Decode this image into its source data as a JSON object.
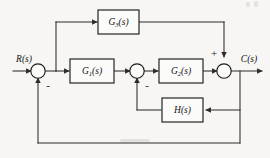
{
  "diagram": {
    "type": "control-system-block-diagram",
    "background_color": "#f7f6f4",
    "line_color": "#2b2b2b",
    "input": {
      "label": "R(s)",
      "name": "input-signal-label"
    },
    "output": {
      "label": "C(s)",
      "name": "output-signal-label"
    },
    "blocks": [
      {
        "id": "g3",
        "label_base": "G",
        "label_sub": "3",
        "label_tail": "(s)",
        "label_full": "G3(s)",
        "role": "feedforward-path"
      },
      {
        "id": "g1",
        "label_base": "G",
        "label_sub": "1",
        "label_tail": "(s)",
        "label_full": "G1(s)",
        "role": "forward-path-first"
      },
      {
        "id": "g2",
        "label_base": "G",
        "label_sub": "2",
        "label_tail": "(s)",
        "label_full": "G2(s)",
        "role": "forward-path-second"
      },
      {
        "id": "h",
        "label_base": "H",
        "label_sub": "",
        "label_tail": "(s)",
        "label_full": "H(s)",
        "role": "inner-feedback"
      }
    ],
    "summing_junctions": [
      {
        "id": "sum1",
        "signs": [
          "-"
        ],
        "sign_visible": "-",
        "role": "outer-feedback-comparator"
      },
      {
        "id": "sum2",
        "signs": [
          "-"
        ],
        "sign_visible": "-",
        "role": "inner-feedback-comparator"
      },
      {
        "id": "sum3",
        "signs": [
          "+"
        ],
        "sign_visible": "+",
        "role": "feedforward-adder"
      }
    ]
  }
}
